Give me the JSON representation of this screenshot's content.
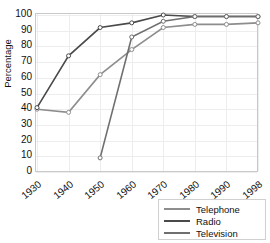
{
  "chart_data": {
    "type": "line",
    "title": "",
    "xlabel": "",
    "ylabel": "Percentage",
    "categories": [
      "1930",
      "1940",
      "1950",
      "1960",
      "1970",
      "1980",
      "1990",
      "1998"
    ],
    "x_tick_labels": [
      "1930",
      "1940",
      "1950",
      "1960",
      "1970",
      "1980",
      "1990",
      "1998"
    ],
    "y_tick_labels": [
      "0",
      "10",
      "20",
      "30",
      "40",
      "50",
      "60",
      "70",
      "80",
      "90",
      "100"
    ],
    "ylim": [
      0,
      100
    ],
    "y_tick_step": 10,
    "grid": true,
    "legend_position": "bottom-right",
    "marker": "open-circle",
    "series": [
      {
        "name": "Telephone",
        "color": "#8d8d8d",
        "values": [
          40,
          38,
          62,
          78,
          92,
          94,
          94,
          95
        ]
      },
      {
        "name": "Radio",
        "color": "#4a4a4a",
        "values": [
          41,
          74,
          92,
          95,
          100,
          99,
          99,
          99
        ]
      },
      {
        "name": "Television",
        "color": "#6f6f6f",
        "values": [
          null,
          null,
          9,
          86,
          96,
          99,
          99,
          99
        ]
      }
    ]
  },
  "legend": {
    "items": [
      {
        "label": "Telephone",
        "color": "#8d8d8d"
      },
      {
        "label": "Radio",
        "color": "#4a4a4a"
      },
      {
        "label": "Television",
        "color": "#6f6f6f"
      }
    ]
  }
}
